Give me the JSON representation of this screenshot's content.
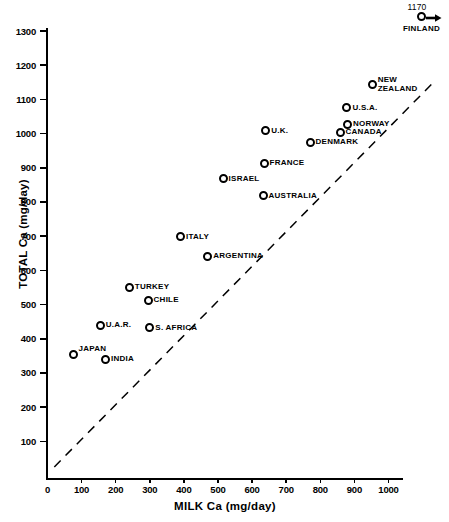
{
  "chart_data": {
    "type": "scatter",
    "title": "",
    "xlabel": "MILK Ca (mg/day)",
    "ylabel": "TOTAL Ca (mg/day)",
    "xlim": [
      0,
      1070
    ],
    "ylim": [
      0,
      1310
    ],
    "grid": false,
    "legend": null,
    "xticks": [
      0,
      100,
      200,
      300,
      400,
      500,
      600,
      700,
      800,
      900,
      1000
    ],
    "yticks": [
      100,
      200,
      300,
      400,
      500,
      600,
      700,
      800,
      900,
      1000,
      1100,
      1200,
      1300
    ],
    "marker_style": "open-circle-black",
    "points": [
      {
        "label": "JAPAN",
        "x": 75,
        "y": 355,
        "label_pos": "right-up"
      },
      {
        "label": "INDIA",
        "x": 170,
        "y": 340,
        "label_pos": "right"
      },
      {
        "label": "U.A.R.",
        "x": 155,
        "y": 440,
        "label_pos": "right"
      },
      {
        "label": "S. AFRICA",
        "x": 300,
        "y": 432,
        "label_pos": "right"
      },
      {
        "label": "TURKEY",
        "x": 240,
        "y": 550,
        "label_pos": "right"
      },
      {
        "label": "CHILE",
        "x": 295,
        "y": 513,
        "label_pos": "right"
      },
      {
        "label": "ITALY",
        "x": 390,
        "y": 698,
        "label_pos": "right"
      },
      {
        "label": "ARGENTINA",
        "x": 470,
        "y": 640,
        "label_pos": "right"
      },
      {
        "label": "ISRAEL",
        "x": 515,
        "y": 868,
        "label_pos": "right"
      },
      {
        "label": "AUSTRALIA",
        "x": 632,
        "y": 818,
        "label_pos": "right"
      },
      {
        "label": "FRANCE",
        "x": 635,
        "y": 913,
        "label_pos": "right"
      },
      {
        "label": "U.K.",
        "x": 640,
        "y": 1008,
        "label_pos": "right"
      },
      {
        "label": "DENMARK",
        "x": 770,
        "y": 975,
        "label_pos": "right"
      },
      {
        "label": "CANADA",
        "x": 858,
        "y": 1003,
        "label_pos": "right"
      },
      {
        "label": "NORWAY",
        "x": 880,
        "y": 1028,
        "label_pos": "right"
      },
      {
        "label": "U.S.A.",
        "x": 878,
        "y": 1075,
        "label_pos": "right"
      },
      {
        "label": "NEW\nZEALAND",
        "x": 952,
        "y": 1143,
        "label_pos": "right"
      }
    ],
    "offscale_point": {
      "label": "FINLAND",
      "value_text": "1170",
      "x": 1170,
      "y": 1170,
      "note": "arrow indicates value extends beyond right edge of x-axis"
    },
    "reference_line": {
      "style": "dashed",
      "description": "diagonal identity-type reference line",
      "from": [
        20,
        25
      ],
      "to": [
        1130,
        1148
      ]
    },
    "colors": {
      "ink": "#000000",
      "background": "#ffffff"
    }
  }
}
